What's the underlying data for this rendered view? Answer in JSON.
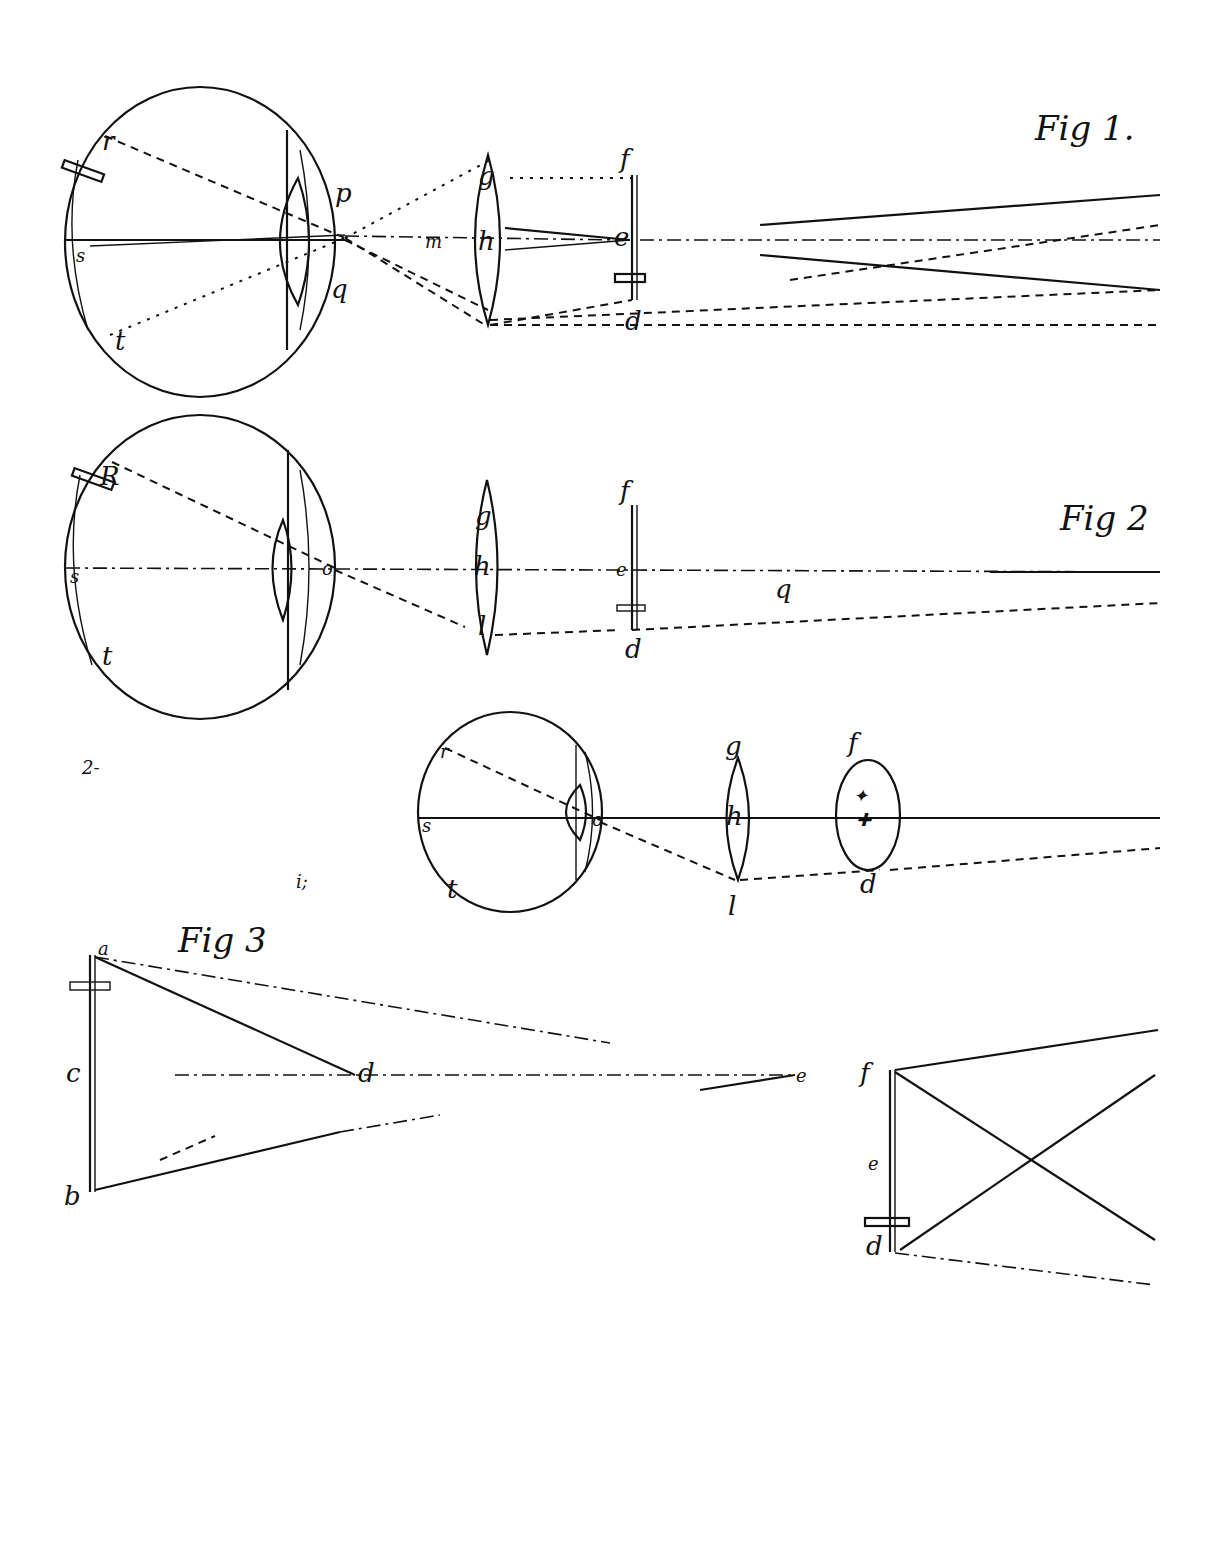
{
  "figures": [
    {
      "title": "Fig 1.",
      "labels": {
        "r": "r",
        "s": "s",
        "t": "t",
        "p": "p",
        "q": "q",
        "m": "m",
        "h": "h",
        "g": "g",
        "l": "l",
        "f": "f",
        "e": "e",
        "d": "d"
      }
    },
    {
      "title": "Fig 2",
      "labels": {
        "r": "R",
        "s": "s",
        "t": "t",
        "o": "o",
        "g": "g",
        "h": "h",
        "l": "l",
        "f": "f",
        "e": "e",
        "d": "d",
        "q": "q"
      }
    },
    {
      "title": "",
      "labels": {
        "r": "r",
        "s": "s",
        "t": "t",
        "o": "o",
        "g": "g",
        "h": "h",
        "l": "l",
        "f": "f",
        "d": "d"
      },
      "side_marks": [
        "2-",
        "i;"
      ]
    },
    {
      "title": "Fig 3",
      "labels": {
        "a": "a",
        "c": "c",
        "b": "b",
        "d": "d",
        "e": "e"
      }
    },
    {
      "title": "",
      "labels": {
        "f": "f",
        "e": "e",
        "d": "d"
      }
    }
  ]
}
